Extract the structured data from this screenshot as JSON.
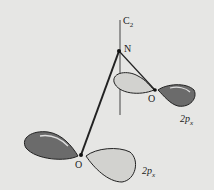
{
  "diagram": {
    "axis_label": "C",
    "axis_sub": "2",
    "atoms": {
      "nitrogen": "N",
      "oxygen_upper": "O",
      "oxygen_lower": "O"
    },
    "orbitals": {
      "upper": {
        "main": "2p",
        "sub": "x"
      },
      "lower": {
        "main": "2p",
        "sub": "x"
      }
    },
    "colors": {
      "background": "#e6e6e4",
      "dark_lobe": "#6b6b6b",
      "light_lobe": "#d2d2cf",
      "line": "#222222"
    }
  }
}
